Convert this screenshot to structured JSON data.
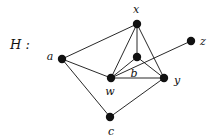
{
  "figure": {
    "name_label": "H :",
    "name_label_x": 10,
    "name_label_y": 38,
    "width": 218,
    "height": 140,
    "background_color": "#ffffff",
    "ink_color": "#111111",
    "vertex_radius": 4.2,
    "edge_width": 0.9
  },
  "graph": {
    "vertices": [
      {
        "id": "a",
        "label": "a",
        "cx": 62,
        "cy": 59,
        "label_x": 50,
        "label_y": 56
      },
      {
        "id": "x",
        "label": "x",
        "cx": 137,
        "cy": 24,
        "label_x": 136,
        "label_y": 9
      },
      {
        "id": "b",
        "label": "b",
        "cx": 137,
        "cy": 57,
        "label_x": 134,
        "label_y": 73
      },
      {
        "id": "w",
        "label": "w",
        "cx": 111,
        "cy": 78,
        "label_x": 110,
        "label_y": 91
      },
      {
        "id": "y",
        "label": "y",
        "cx": 164,
        "cy": 78,
        "label_x": 177,
        "label_y": 80
      },
      {
        "id": "z",
        "label": "z",
        "cx": 191,
        "cy": 41,
        "label_x": 203,
        "label_y": 41
      },
      {
        "id": "c",
        "label": "c",
        "cx": 110,
        "cy": 117,
        "label_x": 111,
        "label_y": 131
      }
    ],
    "edges": [
      {
        "id": "a-x",
        "from": "a",
        "to": "x"
      },
      {
        "id": "a-w",
        "from": "a",
        "to": "w"
      },
      {
        "id": "a-c",
        "from": "a",
        "to": "c"
      },
      {
        "id": "x-w",
        "from": "x",
        "to": "w"
      },
      {
        "id": "x-b",
        "from": "x",
        "to": "b"
      },
      {
        "id": "x-y",
        "from": "x",
        "to": "y"
      },
      {
        "id": "w-b",
        "from": "w",
        "to": "b"
      },
      {
        "id": "w-y",
        "from": "w",
        "to": "y"
      },
      {
        "id": "w-z",
        "from": "w",
        "to": "z"
      },
      {
        "id": "b-y",
        "from": "b",
        "to": "y"
      },
      {
        "id": "c-y",
        "from": "c",
        "to": "y"
      }
    ]
  }
}
